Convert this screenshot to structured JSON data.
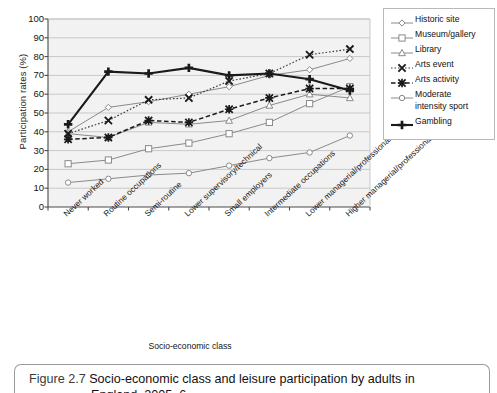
{
  "chart_data": {
    "type": "line",
    "title": "",
    "xlabel": "Socio-economic class",
    "ylabel": "Participation rates (%)",
    "ylim": [
      0,
      100
    ],
    "ytick_step": 10,
    "yticks": [
      0,
      10,
      20,
      30,
      40,
      50,
      60,
      70,
      80,
      90,
      100
    ],
    "grid": true,
    "legend_position": "right",
    "categories": [
      "Never worked",
      "Routine occupations",
      "Semi-routine",
      "Lower supervisory/technical",
      "Small employers",
      "Intermediate occupations",
      "Lower managerial/professional",
      "Higher managerial/professional"
    ],
    "series": [
      {
        "name": "Historic site",
        "marker": "diamond-open",
        "line": "solid-thin",
        "values": [
          40,
          53,
          56,
          60,
          64,
          70,
          73,
          79
        ]
      },
      {
        "name": "Museum/gallery",
        "marker": "square-open",
        "line": "solid-thin",
        "values": [
          23,
          25,
          31,
          34,
          39,
          45,
          55,
          64
        ]
      },
      {
        "name": "Library",
        "marker": "triangle-open",
        "line": "solid-thin",
        "values": [
          39,
          37,
          45,
          44,
          46,
          54,
          60,
          58
        ]
      },
      {
        "name": "Arts event",
        "marker": "x-cross",
        "line": "dotted",
        "values": [
          39,
          46,
          57,
          58,
          67,
          71,
          81,
          84
        ]
      },
      {
        "name": "Arts activity",
        "marker": "asterisk",
        "line": "dashed",
        "values": [
          36,
          37,
          46,
          45,
          52,
          58,
          63,
          63
        ]
      },
      {
        "name": "Moderate intensity sport",
        "marker": "circle-open",
        "line": "solid-thin",
        "values": [
          13,
          15,
          17,
          18,
          22,
          26,
          29,
          38
        ]
      },
      {
        "name": "Gambling",
        "marker": "plus-bold",
        "line": "solid-bold",
        "values": [
          44,
          72,
          71,
          74,
          70,
          71,
          68,
          62
        ]
      }
    ]
  },
  "legend": {
    "items": [
      {
        "label": "Historic site",
        "icon": "diamond-open-marker-icon"
      },
      {
        "label": "Museum/gallery",
        "icon": "square-open-marker-icon"
      },
      {
        "label": "Library",
        "icon": "triangle-open-marker-icon"
      },
      {
        "label": "Arts event",
        "icon": "x-cross-marker-icon"
      },
      {
        "label": "Arts activity",
        "icon": "asterisk-marker-icon"
      },
      {
        "label": "Moderate\nintensity sport",
        "icon": "circle-open-marker-icon"
      },
      {
        "label": "Gambling",
        "icon": "plus-bold-marker-icon"
      }
    ]
  },
  "axes": {
    "y_title": "Participation rates (%)",
    "x_title": "Socio-economic class"
  },
  "caption": {
    "label": "Figure 2.7",
    "line1": "Socio-economic class and leisure participation by adults in",
    "line2": "England, 2005–6"
  },
  "colors": {
    "grid": "#c8c8c8",
    "axis": "#4a4a4a",
    "series_light": "#8a8a8a",
    "series_dark": "#1a1a1a",
    "plot_background": "#f2f2f2"
  }
}
